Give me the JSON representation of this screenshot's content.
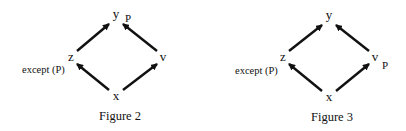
{
  "figures": [
    {
      "caption": "Figure 2",
      "nodes": {
        "y": {
          "label": "y",
          "x": 116,
          "y": 18
        },
        "z": {
          "label": "z",
          "x": 71,
          "y": 61
        },
        "v": {
          "label": "v",
          "x": 163,
          "y": 61
        },
        "x": {
          "label": "x",
          "x": 116,
          "y": 100
        }
      },
      "edges": [
        {
          "from": "x",
          "to": "z"
        },
        {
          "from": "x",
          "to": "v"
        },
        {
          "from": "z",
          "to": "y"
        },
        {
          "from": "v",
          "to": "y"
        }
      ],
      "annotations": {
        "property_label": "P",
        "property_attached_to": "y",
        "exception_label": "except (P)",
        "exception_attached_to": "z"
      }
    },
    {
      "caption": "Figure 3",
      "nodes": {
        "y": {
          "label": "y",
          "x": 329,
          "y": 19
        },
        "z": {
          "label": "z",
          "x": 283,
          "y": 61
        },
        "v": {
          "label": "v",
          "x": 375,
          "y": 61
        },
        "x": {
          "label": "x",
          "x": 329,
          "y": 101
        }
      },
      "edges": [
        {
          "from": "x",
          "to": "z"
        },
        {
          "from": "x",
          "to": "v"
        },
        {
          "from": "z",
          "to": "y"
        },
        {
          "from": "v",
          "to": "y"
        }
      ],
      "annotations": {
        "property_label": "P",
        "property_attached_to": "v",
        "exception_label": "except (P)",
        "exception_attached_to": "z"
      }
    }
  ],
  "colors": {
    "ink": "#111111",
    "background": "#ffffff"
  }
}
